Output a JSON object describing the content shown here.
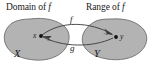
{
  "figure": {
    "title_hint": "inverse-function-mapping-diagram",
    "colors": {
      "blob_fill": "#b3b3b3",
      "blob_stroke": "#6e6e6e",
      "arrow": "#3b3b3b",
      "point": "#111111",
      "text": "#1a1a1a",
      "background": "#ffffff"
    }
  },
  "headers": {
    "domain": {
      "text": "Domain of ",
      "symbol": "f"
    },
    "range": {
      "text": "Range of ",
      "symbol": "f"
    }
  },
  "sets": {
    "left": {
      "label": "X",
      "name": "set-x"
    },
    "right": {
      "label": "Y",
      "name": "set-y"
    }
  },
  "points": {
    "x": {
      "label": "x",
      "in_set": "X"
    },
    "y": {
      "label": "y",
      "in_set": "Y"
    }
  },
  "maps": {
    "forward": {
      "label": "f",
      "from": "x",
      "to": "y",
      "direction": "left-to-right"
    },
    "backward": {
      "label": "g",
      "from": "y",
      "to": "x",
      "direction": "right-to-left"
    }
  }
}
